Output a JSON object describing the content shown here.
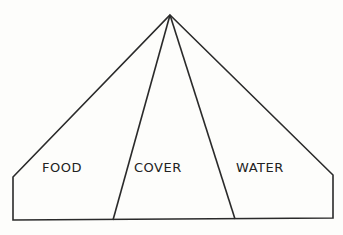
{
  "diagram": {
    "title": "",
    "shape": "pentagon-with-apex",
    "stroke_color": "#2a2a2a",
    "background_color": "#fdfdfb",
    "apex": [
      170,
      15
    ],
    "outline_points": [
      [
        170,
        15
      ],
      [
        333,
        175
      ],
      [
        333,
        218
      ],
      [
        13,
        220
      ],
      [
        13,
        177
      ]
    ],
    "dividers": [
      {
        "from": [
          170,
          15
        ],
        "to": [
          113,
          220
        ]
      },
      {
        "from": [
          170,
          15
        ],
        "to": [
          235,
          219
        ]
      }
    ],
    "sections": [
      {
        "id": "food",
        "label": "FOOD",
        "x": 42,
        "y": 161
      },
      {
        "id": "cover",
        "label": "COVER",
        "x": 134,
        "y": 161
      },
      {
        "id": "water",
        "label": "WATER",
        "x": 236,
        "y": 161
      }
    ]
  }
}
